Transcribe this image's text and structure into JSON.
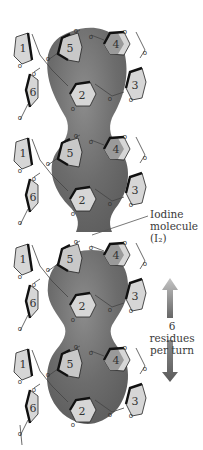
{
  "figure": {
    "residue_labels": [
      "1",
      "2",
      "3",
      "4",
      "5",
      "6"
    ],
    "oxygen_label": "o",
    "turns": 4,
    "annotations": {
      "iodine_line1": "Iodine",
      "iodine_line2": "molecule",
      "iodine_line3": "(I₂)",
      "arrow_line1": "6 residues",
      "arrow_line2": "per turn"
    },
    "colors": {
      "blob": "#6e6e6e",
      "blob_highlight": "#8a8a8a",
      "ring_fill": "#d6d6d6",
      "ring_dark_fill": "#9a9a9a",
      "ring_edge": "#111111",
      "arrow_top": "#b8b8b8",
      "arrow_bottom": "#6a6a6a"
    }
  }
}
